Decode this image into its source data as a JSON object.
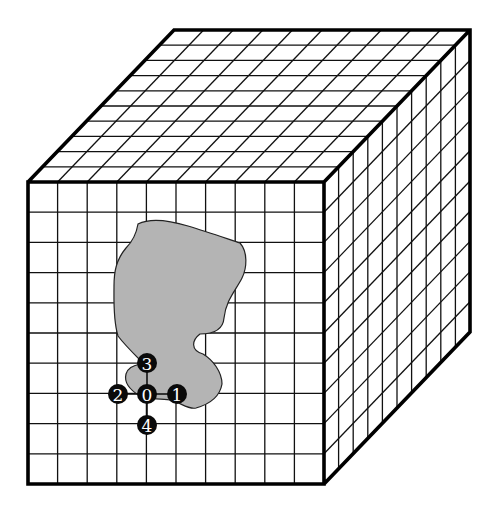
{
  "diagram": {
    "title": "",
    "type": "3D grid cube with region and neighbor stencil",
    "cube": {
      "front_face": {
        "x0": 28,
        "y0": 182,
        "x1": 324,
        "y1": 484
      },
      "depth_offset": {
        "dx": 146,
        "dy": -152
      },
      "divisions": {
        "width": 10,
        "height": 10,
        "depth": 10
      },
      "line_color": "#111111",
      "edge_color": "#000000"
    },
    "region": {
      "fill": "#b4b4b4",
      "outline": "#222222",
      "path": "M138,224 C150,218 168,220 188,226 C205,231 225,238 240,243 C248,252 247,268 242,278 C236,290 226,300 224,318 C223,330 214,334 200,334 C192,340 190,350 203,354 C213,360 222,372 222,384 C220,396 210,404 196,408 C188,410 180,402 170,400 C158,398 146,400 140,396 C130,390 124,382 126,374 C128,368 132,366 140,364 L140,360 C132,352 124,344 118,336 C113,320 114,300 114,286 C114,272 116,260 126,248 C132,242 136,236 138,224 Z"
    },
    "stencil": {
      "nodes": [
        {
          "label": "0",
          "x": 147,
          "y": 394
        },
        {
          "label": "1",
          "x": 177,
          "y": 394
        },
        {
          "label": "2",
          "x": 118,
          "y": 394
        },
        {
          "label": "3",
          "x": 147,
          "y": 363
        },
        {
          "label": "4",
          "x": 147,
          "y": 425
        }
      ],
      "node_radius": 10,
      "node_fill": "#0a0a0a",
      "label_color": "#ffffff"
    }
  }
}
